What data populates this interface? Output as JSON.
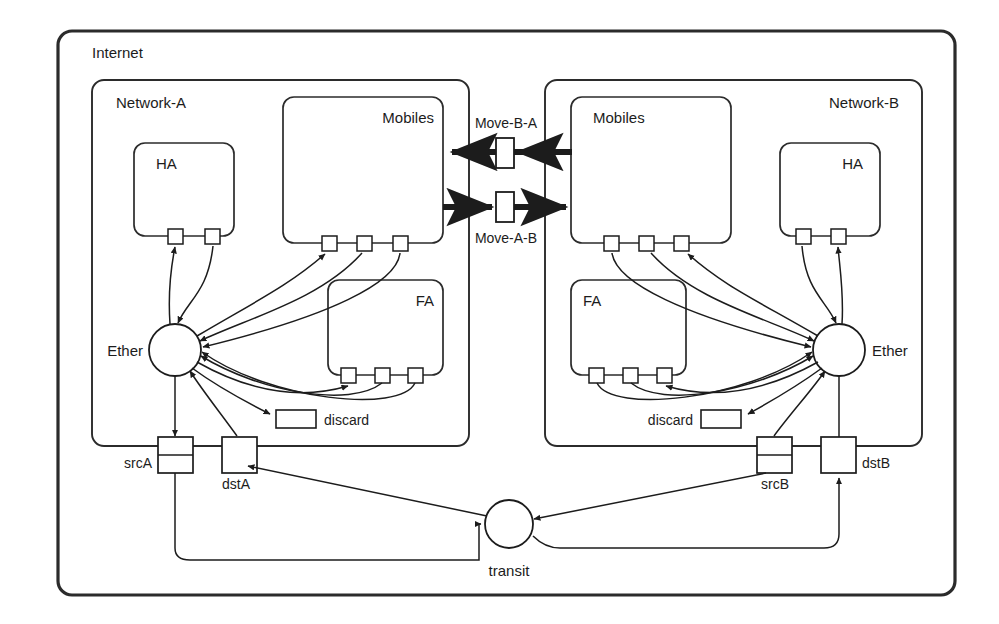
{
  "diagram": {
    "title": "Internet",
    "outer": {
      "label": "Internet"
    },
    "networks": [
      {
        "id": "network-a",
        "label": "Network-A"
      },
      {
        "id": "network-b",
        "label": "Network-B"
      }
    ],
    "agents": [
      {
        "id": "ha-a",
        "label": "HA",
        "network": "Network-A",
        "ports": 2
      },
      {
        "id": "mobiles-a",
        "label": "Mobiles",
        "network": "Network-A",
        "ports": 3
      },
      {
        "id": "fa-a",
        "label": "FA",
        "network": "Network-A",
        "ports": 3
      },
      {
        "id": "mobiles-b",
        "label": "Mobiles",
        "network": "Network-B",
        "ports": 3
      },
      {
        "id": "fa-b",
        "label": "FA",
        "network": "Network-B",
        "ports": 3
      },
      {
        "id": "ha-b",
        "label": "HA",
        "network": "Network-B",
        "ports": 2
      }
    ],
    "nodes": [
      {
        "id": "ether-a",
        "label": "Ether",
        "shape": "circle",
        "network": "Network-A"
      },
      {
        "id": "ether-b",
        "label": "Ether",
        "shape": "circle",
        "network": "Network-B"
      },
      {
        "id": "transit",
        "label": "transit",
        "shape": "circle",
        "network": "Internet"
      }
    ],
    "interfaces": [
      {
        "id": "srca",
        "label": "srcA",
        "shape": "rect-split"
      },
      {
        "id": "dsta",
        "label": "dstA",
        "shape": "rect"
      },
      {
        "id": "srcb",
        "label": "srcB",
        "shape": "rect-split"
      },
      {
        "id": "dstb",
        "label": "dstB",
        "shape": "rect"
      }
    ],
    "sinks": [
      {
        "id": "discard-a",
        "label": "discard"
      },
      {
        "id": "discard-b",
        "label": "discard"
      }
    ],
    "mobility_links": [
      {
        "id": "move-b-a",
        "label": "Move-B-A",
        "direction": "right-to-left",
        "style": "thick-arrow"
      },
      {
        "id": "move-a-b",
        "label": "Move-A-B",
        "direction": "left-to-right",
        "style": "thick-arrow"
      }
    ],
    "colors": {
      "stroke": "#1c1c1c",
      "outer_stroke": "#2b2b2b",
      "fill": "#ffffff",
      "background": "#ffffff"
    }
  }
}
